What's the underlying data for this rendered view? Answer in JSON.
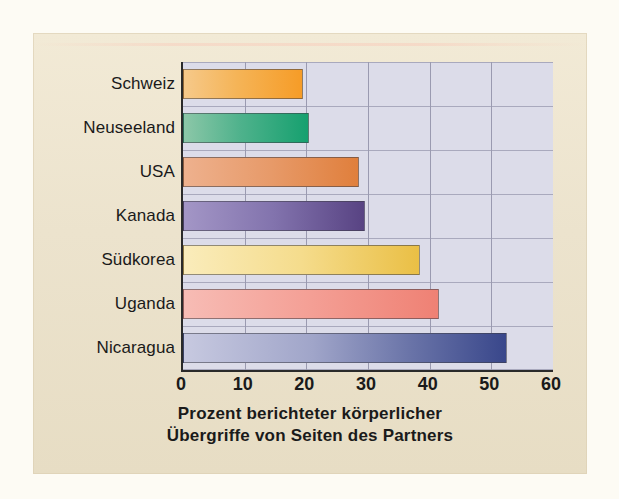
{
  "chart_data": {
    "type": "bar",
    "orientation": "horizontal",
    "title": "",
    "subtitle": "",
    "caption_line1": "Prozent berichteter körperlicher",
    "caption_line2": "Übergriffe von Seiten des Partners",
    "xlabel": "Prozent berichteter körperlicher Übergriffe von Seiten des Partners",
    "ylabel": "",
    "categories": [
      "Schweiz",
      "Neuseeland",
      "USA",
      "Kanada",
      "Südkorea",
      "Uganda",
      "Nicaragua"
    ],
    "values": [
      19.5,
      20.5,
      28.5,
      29.5,
      38.5,
      41.5,
      52.5
    ],
    "xlim": [
      0,
      60
    ],
    "xticks": [
      0,
      10,
      20,
      30,
      40,
      50,
      60
    ],
    "xtick_labels": [
      "0",
      "10",
      "20",
      "30",
      "40",
      "50",
      "60"
    ],
    "grid": "vertical-and-horizontal",
    "legend": "none",
    "bar_colors": [
      {
        "category": "Schweiz",
        "from": "#f6c98a",
        "to": "#f69c27"
      },
      {
        "category": "Neuseeland",
        "from": "#8cc7a8",
        "to": "#16a06f"
      },
      {
        "category": "USA",
        "from": "#eeb18e",
        "to": "#e07f3c"
      },
      {
        "category": "Kanada",
        "from": "#a396c6",
        "to": "#584383"
      },
      {
        "category": "Südkorea",
        "from": "#faecbb",
        "to": "#eabf45"
      },
      {
        "category": "Uganda",
        "from": "#f7bcb5",
        "to": "#ef8174"
      },
      {
        "category": "Nicaragua",
        "from": "#c7c9e0",
        "to": "#39478b"
      }
    ],
    "plot_background": "#dcdce9",
    "panel_background": "#ece3cd",
    "axis_color": "#2a2a2a",
    "gridline_color": "#9a9ab0"
  }
}
